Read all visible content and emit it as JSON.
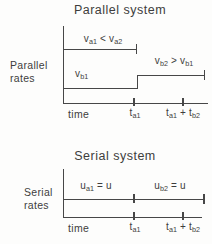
{
  "colors": {
    "background": "#fdfdfc",
    "ink": "#474747"
  },
  "parallel_chart": {
    "title": "Parallel system",
    "y_axis_label_line1": "Parallel",
    "y_axis_label_line2": "rates",
    "x_axis_label": "time",
    "line_a_label": "v_{a1} < v_{a2}",
    "line_b_low_label": "v_{b1}",
    "line_b_high_label": "v_{b2} > v_{b1}",
    "x_tick_1_label": "t_{a1}",
    "x_tick_2_label": "t_{a1} + t_{b2}"
  },
  "serial_chart": {
    "title": "Serial system",
    "y_axis_label_line1": "Serial",
    "y_axis_label_line2": "rates",
    "x_axis_label": "time",
    "segment_a_label": "u_{a1} = u",
    "segment_b_label": "u_{b2} = u",
    "x_tick_1_label": "t_{a1}",
    "x_tick_2_label": "t_{a1} + t_{b2}"
  },
  "chart_data": [
    {
      "type": "line",
      "title": "Parallel system",
      "xlabel": "time",
      "ylabel": "Parallel rates",
      "x_ticks": [
        "t_a1",
        "t_a1 + t_b2"
      ],
      "grid": false,
      "legend": "none",
      "series": [
        {
          "name": "reaction a rate",
          "segments": [
            {
              "from_x": "0",
              "to_x": "t_a1",
              "level": "v_a1",
              "annotation": "v_a1 < v_a2"
            }
          ]
        },
        {
          "name": "reaction b rate",
          "segments": [
            {
              "from_x": "0",
              "to_x": "t_a1",
              "level": "v_b1",
              "annotation": "v_b1"
            },
            {
              "from_x": "t_a1",
              "to_x": "t_a1 + t_b2",
              "level": "v_b2",
              "annotation": "v_b2 > v_b1"
            }
          ]
        }
      ]
    },
    {
      "type": "line",
      "title": "Serial system",
      "xlabel": "time",
      "ylabel": "Serial rates",
      "x_ticks": [
        "t_a1",
        "t_a1 + t_b2"
      ],
      "grid": false,
      "legend": "none",
      "series": [
        {
          "name": "serial rate",
          "segments": [
            {
              "from_x": "0",
              "to_x": "t_a1",
              "level": "u",
              "annotation": "u_a1 = u"
            },
            {
              "from_x": "t_a1",
              "to_x": "t_a1 + t_b2",
              "level": "u",
              "annotation": "u_b2 = u"
            }
          ]
        }
      ]
    }
  ]
}
